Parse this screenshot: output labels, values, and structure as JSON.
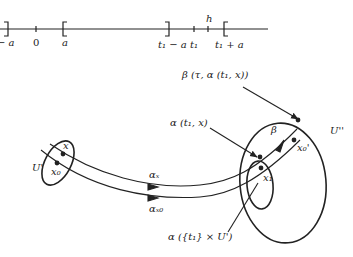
{
  "number_line": {
    "labels": {
      "neg_a": "− a",
      "zero": "0",
      "a": "a",
      "t1_minus_a": "t₁ − a",
      "t1": "t₁",
      "t1_plus_a": "t₁ + a",
      "h": "h"
    }
  },
  "flow_diagram": {
    "labels": {
      "U_prime": "U'",
      "x": "x",
      "x0": "x₀",
      "alpha_x": "αₓ",
      "alpha_x0": "αₓ₀",
      "alpha_t1_x": "α (t₁, x)",
      "beta_label": "β (τ, α (t₁, x))",
      "beta": "β",
      "U_double_prime": "U''",
      "x1": "x₁",
      "x0_prime": "x₀'",
      "alpha_set": "α ({t₁} × U')"
    }
  },
  "colors": {
    "ink": "#222222",
    "background": "#ffffff"
  }
}
